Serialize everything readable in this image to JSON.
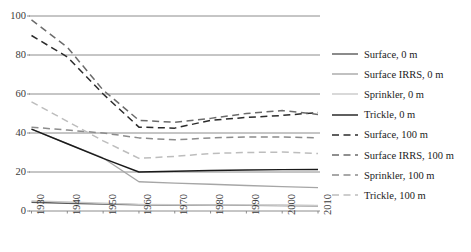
{
  "chart_data": {
    "type": "line",
    "title": "",
    "xlabel": "",
    "ylabel": "",
    "x": [
      1930,
      1940,
      1950,
      1960,
      1970,
      1980,
      1990,
      2000,
      2010
    ],
    "categories": [
      "1930",
      "1940",
      "1950",
      "1960",
      "1970",
      "1980",
      "1990",
      "2000",
      "2010"
    ],
    "xlim": [
      1930,
      2010
    ],
    "ylim": [
      0,
      100
    ],
    "yticks": [
      0,
      20,
      40,
      60,
      80,
      100
    ],
    "grid": "horizontal",
    "legend_position": "right",
    "series": [
      {
        "name": "Surface, 0 m",
        "dash": "solid",
        "color": "#595959",
        "values": [
          4.5,
          4.0,
          3.6,
          3.2,
          3.1,
          3.0,
          2.9,
          2.8,
          2.7
        ]
      },
      {
        "name": "Surface IRRS, 0 m",
        "dash": "solid",
        "color": "#a6a6a6",
        "values": [
          42.0,
          34.6,
          27.2,
          15.0,
          14.3,
          13.7,
          13.1,
          12.5,
          12.0
        ]
      },
      {
        "name": "Sprinkler, 0 m",
        "dash": "solid",
        "color": "#c9c9c9",
        "values": [
          5.2,
          4.6,
          4.0,
          3.4,
          3.2,
          3.1,
          3.0,
          2.9,
          2.8
        ]
      },
      {
        "name": "Trickle, 0 m",
        "dash": "solid",
        "color": "#1a1a1a",
        "values": [
          42.0,
          34.5,
          27.0,
          20.0,
          20.4,
          20.8,
          21.0,
          21.2,
          21.3
        ]
      },
      {
        "name": "Surface, 100 m",
        "dash": "dashed",
        "color": "#2b2b2b",
        "values": [
          90.0,
          79.0,
          60.0,
          43.0,
          42.5,
          46.5,
          48.0,
          49.0,
          50.5
        ]
      },
      {
        "name": "Surface IRRS, 100 m",
        "dash": "dashed",
        "color": "#6b6b6b",
        "values": [
          98.0,
          84.0,
          62.0,
          46.5,
          45.5,
          47.5,
          50.0,
          51.5,
          49.5
        ]
      },
      {
        "name": "Sprinkler, 100 m",
        "dash": "dashed",
        "color": "#8c8c8c",
        "values": [
          43.0,
          41.5,
          40.0,
          37.5,
          36.5,
          37.5,
          38.0,
          38.0,
          37.5
        ]
      },
      {
        "name": "Trickle, 100 m",
        "dash": "dashed",
        "color": "#bdbdbd",
        "values": [
          56.0,
          46.0,
          36.0,
          27.0,
          28.0,
          29.5,
          30.0,
          30.2,
          29.5
        ]
      }
    ]
  },
  "legend": {
    "items": [
      {
        "label": "Surface, 0 m"
      },
      {
        "label": "Surface IRRS, 0 m"
      },
      {
        "label": "Sprinkler, 0 m"
      },
      {
        "label": "Trickle, 0 m"
      },
      {
        "label": "Surface, 100 m"
      },
      {
        "label": "Surface IRRS, 100 m"
      },
      {
        "label": "Sprinkler, 100 m"
      },
      {
        "label": "Trickle, 100 m"
      }
    ]
  },
  "axes": {
    "y_labels": [
      "100",
      "80",
      "60",
      "40",
      "20",
      "0"
    ],
    "x_labels": [
      "1930",
      "1940",
      "1950",
      "1960",
      "1970",
      "1980",
      "1990",
      "2000",
      "2010"
    ]
  },
  "colors": {
    "gridline": "#808080",
    "axis_text": "#3b3b3b",
    "background": "#ffffff"
  }
}
